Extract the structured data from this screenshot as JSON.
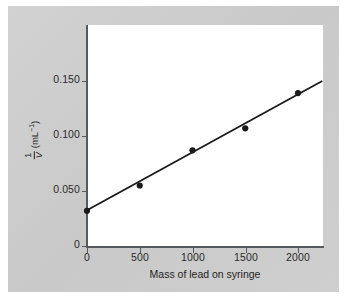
{
  "chart_data": {
    "type": "scatter",
    "title": "",
    "xlabel": "Mass of lead on syringe",
    "ylabel_numerator": "1",
    "ylabel_denominator": "V",
    "ylabel_units": "(mL",
    "ylabel_units_exp": "−1",
    "ylabel_units_close": ")",
    "ylabel_full": "1/V (mL⁻¹)",
    "x": [
      0,
      500,
      1000,
      1500,
      2000
    ],
    "y": [
      0.032,
      0.055,
      0.087,
      0.107,
      0.139
    ],
    "xticks": [
      "0",
      "500",
      "1000",
      "1500",
      "2000"
    ],
    "xtick_values": [
      0,
      500,
      1000,
      1500,
      2000
    ],
    "yticks": [
      "0",
      "0.050",
      "0.100",
      "0.150"
    ],
    "ytick_values": [
      0,
      0.05,
      0.1,
      0.15
    ],
    "xlim": [
      0,
      2230
    ],
    "ylim": [
      0,
      0.2
    ],
    "grid": false,
    "legend": false,
    "series": [
      {
        "name": "measured",
        "marker": "filled-circle",
        "marker_color": "#1a1a1a",
        "values": [
          0.032,
          0.055,
          0.087,
          0.107,
          0.139
        ]
      },
      {
        "name": "best-fit-line",
        "type": "line",
        "color": "#1a1a1a",
        "intercept": 0.0325,
        "slope_per_unit": 5.25e-05,
        "x_start": 0,
        "x_end": 2230,
        "y_start": 0.0325,
        "y_end": 0.15
      }
    ]
  },
  "colors": {
    "plate_background": "#cdcdcd",
    "panel_background": "#ffffff",
    "axis": "#555a5e",
    "data": "#1a1a1a",
    "text": "#1f1f1f"
  }
}
